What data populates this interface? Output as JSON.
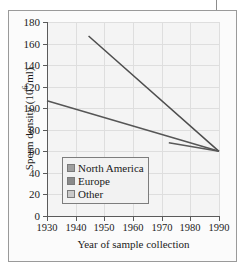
{
  "chart_data": {
    "type": "line",
    "title": "",
    "xlabel": "Year of sample collection",
    "ylabel": "Sperm density (10⁶/ml)",
    "ylabel_main": "Sperm density (10",
    "ylabel_sup": "6",
    "ylabel_tail": "/ml)",
    "xlim": [
      1930,
      1990
    ],
    "ylim": [
      0,
      180
    ],
    "xticks": [
      1930,
      1940,
      1950,
      1960,
      1970,
      1980,
      1990
    ],
    "yticks": [
      0,
      20,
      40,
      60,
      80,
      100,
      120,
      140,
      160,
      180
    ],
    "grid": true,
    "legend_position": "lower-left-inside",
    "series": [
      {
        "name": "North America",
        "color": "#4d4d4d",
        "swatch_color": "#9e9e9e",
        "points": [
          [
            1944.5,
            167
          ],
          [
            1990,
            60
          ]
        ]
      },
      {
        "name": "Europe",
        "color": "#5a5a5a",
        "swatch_color": "#8a8a8a",
        "points": [
          [
            1972.5,
            68
          ],
          [
            1990,
            60
          ]
        ]
      },
      {
        "name": "Other",
        "color": "#565656",
        "swatch_color": "#c9c9c9",
        "points": [
          [
            1930,
            107
          ],
          [
            1990,
            60
          ]
        ]
      }
    ]
  },
  "axis": {
    "x_tick_labels": [
      "1930",
      "1940",
      "1950",
      "1960",
      "1970",
      "1980",
      "1990"
    ],
    "y_tick_labels": [
      "0",
      "20",
      "40",
      "60",
      "80",
      "100",
      "120",
      "140",
      "160",
      "180"
    ]
  },
  "legend": {
    "items": [
      {
        "label": "North America"
      },
      {
        "label": "Europe"
      },
      {
        "label": "Other"
      }
    ]
  }
}
